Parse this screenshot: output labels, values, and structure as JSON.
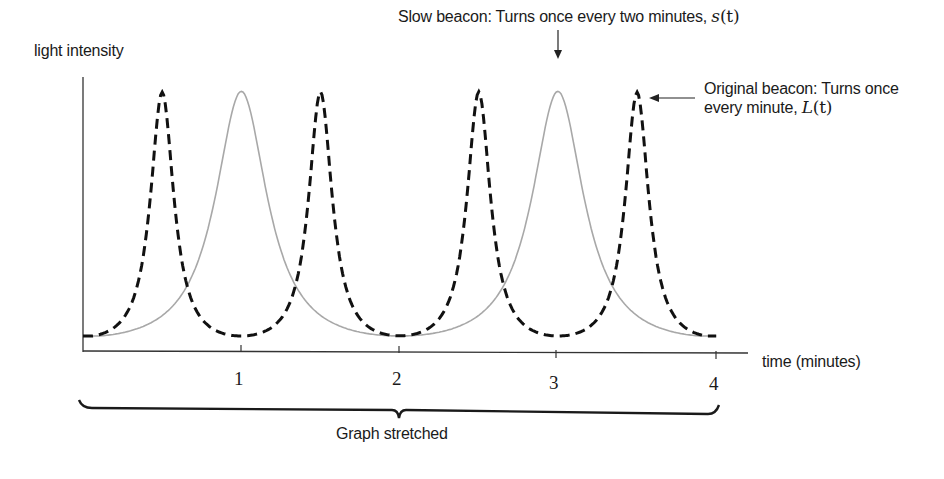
{
  "chart_data": {
    "type": "line",
    "title": "",
    "xlabel": "time (minutes)",
    "ylabel": "light intensity",
    "xlim": [
      0,
      4.2
    ],
    "ylim": [
      0,
      1
    ],
    "grid": false,
    "x_ticks": [
      "1",
      "2",
      "3",
      "4"
    ],
    "x_tick_values": [
      1,
      2,
      3,
      4
    ],
    "series": [
      {
        "name": "Original beacon: Turns once every minute, L(t)",
        "style": "dashed",
        "color": "#111111",
        "period": 1,
        "peaks_at": [
          0.5,
          1.5,
          2.5,
          3.5
        ],
        "peak_value": 1.0,
        "min_value": 0.0,
        "min_at": [
          0,
          1,
          2,
          3,
          4
        ]
      },
      {
        "name": "Slow beacon: Turns once every two minutes, s(t)",
        "style": "solid",
        "color": "#a8a8a8",
        "period": 2,
        "peaks_at": [
          1,
          3
        ],
        "peak_value": 1.0,
        "min_value": 0.0,
        "min_at": [
          0,
          2,
          4
        ]
      }
    ],
    "annotations": [
      {
        "text": "Slow beacon: Turns once every two minutes,",
        "math": "s(t)",
        "arrow_to": {
          "x": 3,
          "y": 1.0
        },
        "arrow_dir": "down"
      },
      {
        "text_line1": "Original beacon: Turns once",
        "text_line2": "every minute,",
        "math": "L(t)",
        "arrow_to": {
          "x": 3.5,
          "y": 1.0
        },
        "arrow_dir": "left"
      },
      {
        "text": "Graph stretched",
        "type": "brace",
        "span": [
          0,
          4
        ]
      }
    ]
  },
  "labels": {
    "y_axis": "light intensity",
    "x_axis": "time (minutes)",
    "slow_beacon_text": "Slow beacon: Turns once every two minutes, ",
    "slow_beacon_math_fn": "s",
    "slow_beacon_math_arg": "(t)",
    "orig_beacon_line1": "Original beacon: Turns once",
    "orig_beacon_line2": "every minute, ",
    "orig_beacon_math_fn": "L",
    "orig_beacon_math_arg": "(t)",
    "brace_label": "Graph stretched",
    "tick_1": "1",
    "tick_2": "2",
    "tick_3": "3",
    "tick_4": "4"
  },
  "colors": {
    "dashed_curve": "#111111",
    "solid_curve": "#a8a8a8",
    "axis": "#333333"
  }
}
